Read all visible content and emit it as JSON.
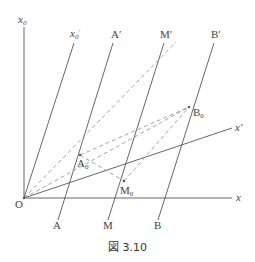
{
  "figure": {
    "caption": "図 3.10",
    "axes": {
      "x_label": "x",
      "x0_label": "x",
      "x0_sub": "0",
      "x0_prime_label": "x",
      "x0_prime_sub": "0",
      "x0_prime_mark": "′",
      "x_prime_label": "x′",
      "origin_label": "O"
    },
    "worldlines": [
      {
        "bottom_label": "A",
        "top_label": "A′"
      },
      {
        "bottom_label": "M",
        "top_label": "M′"
      },
      {
        "bottom_label": "B",
        "top_label": "B′"
      }
    ],
    "events": {
      "A0": {
        "label": "A",
        "sub": "0"
      },
      "M0": {
        "label": "M",
        "sub": "0"
      },
      "B0": {
        "label": "B",
        "sub": "0"
      }
    },
    "colors": {
      "solid_line": "#555555",
      "dashed_line": "#999999",
      "text": "#444444"
    }
  }
}
